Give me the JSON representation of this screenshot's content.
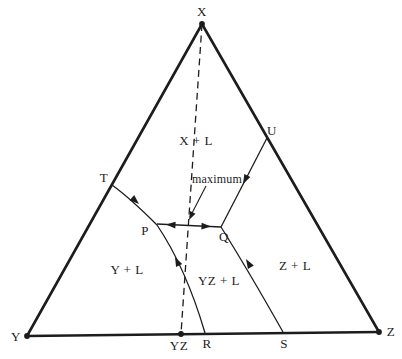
{
  "diagram_type": "ternary liquidus phase diagram with binary compound YZ and a temperature maximum on boundary curve P-Q",
  "colors": {
    "ink": "#1c1c1c",
    "background": "#ffffff"
  },
  "triangle": {
    "vertex_top": "X",
    "vertex_bottom_left": "Y",
    "vertex_bottom_right": "Z"
  },
  "points": {
    "t": "T",
    "u": "U",
    "p": "P",
    "q": "Q",
    "r": "R",
    "s": "S",
    "yz": "YZ"
  },
  "regions": {
    "x_l": "X + L",
    "y_l": "Y + L",
    "yz_l": "YZ + L",
    "z_l": "Z + L"
  },
  "annotation": {
    "maximum": "maximum"
  }
}
